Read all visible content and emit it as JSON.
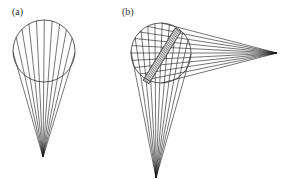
{
  "panels": [
    {
      "label": "(a)",
      "circle": {
        "cx": 44,
        "cy": 51,
        "r": 31
      },
      "apex": {
        "x": 43,
        "y": 157
      },
      "ray_count": 11
    },
    {
      "label": "(b)",
      "circle": {
        "cx": 161,
        "cy": 53,
        "r": 30
      },
      "apex_bottom": {
        "x": 156,
        "y": 178
      },
      "apex_right": {
        "x": 277,
        "y": 53
      },
      "ray_count": 11,
      "strip": {
        "x1": 146,
        "y1": 82,
        "x2": 178,
        "y2": 30,
        "width": 7
      }
    }
  ],
  "colors": {
    "line": "#1a1a1a",
    "circle": "#333333"
  }
}
